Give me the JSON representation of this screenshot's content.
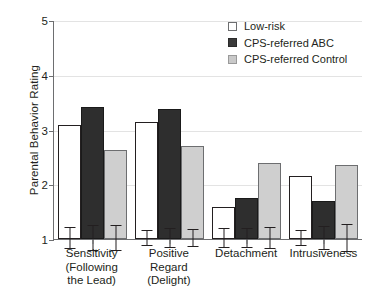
{
  "chart_data": {
    "type": "bar",
    "title": "",
    "xlabel": "",
    "ylabel": "Parental Behavior Rating",
    "ylim": [
      1,
      5
    ],
    "yticks": [
      1,
      2,
      3,
      4,
      5
    ],
    "ytick_labels": [
      "1",
      "2",
      "3",
      "4",
      "5"
    ],
    "grid": true,
    "grid_axis": "y",
    "legend_position": "top-right",
    "categories": [
      "Sensitivity (Following the Lead)",
      "Positive Regard (Delight)",
      "Detachment",
      "Intrusiveness"
    ],
    "category_lines": [
      [
        "Sensitivity",
        "(Following",
        "the Lead)"
      ],
      [
        "Positive",
        "Regard",
        "(Delight)"
      ],
      [
        "Detachment"
      ],
      [
        "Intrusiveness"
      ]
    ],
    "series": [
      {
        "name": "Low-risk",
        "color": "#ffffff",
        "values": [
          3.08,
          3.14,
          1.58,
          2.15
        ],
        "errors": [
          0.2,
          0.15,
          0.18,
          0.14
        ]
      },
      {
        "name": "CPS-referred ABC",
        "color": "#2e2e2e",
        "values": [
          3.42,
          3.38,
          1.75,
          1.7
        ],
        "errors": [
          0.24,
          0.18,
          0.18,
          0.22
        ]
      },
      {
        "name": "CPS-referred Control",
        "color": "#cfcfcf",
        "values": [
          2.62,
          2.7,
          2.39,
          2.36
        ],
        "errors": [
          0.24,
          0.16,
          0.21,
          0.25
        ]
      }
    ]
  },
  "legend": {
    "items": [
      {
        "label": "Low-risk",
        "swatch": "white-square-icon"
      },
      {
        "label": "CPS-referred ABC",
        "swatch": "dark-square-icon"
      },
      {
        "label": "CPS-referred Control",
        "swatch": "gray-square-icon"
      }
    ]
  }
}
